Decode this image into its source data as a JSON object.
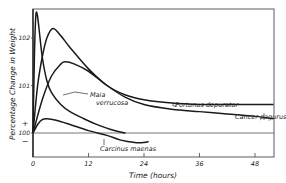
{
  "chart_data": {
    "type": "line",
    "title": "",
    "xlabel": "Time (hours)",
    "ylabel": "Percentage Change in Weight",
    "xlim": [
      0,
      52
    ],
    "ylim": [
      99.5,
      102.6
    ],
    "x_ticks": [
      0,
      12,
      24,
      36,
      48
    ],
    "x_tick_labels": [
      "0",
      "12",
      "24",
      "36",
      "48"
    ],
    "y_ticks": [
      100,
      101,
      102
    ],
    "y_tick_labels": [
      "100",
      "101",
      "102"
    ],
    "y_sign_labels": {
      "plus": "+",
      "minus": "−"
    },
    "reference_line": 100,
    "grid": false,
    "legend": "inline labels",
    "series": [
      {
        "name": "Maia verrucosa",
        "x": [
          0,
          0.3,
          0.6,
          0.9,
          1.3,
          2,
          3,
          4,
          6,
          8,
          11,
          14,
          17,
          20
        ],
        "values": [
          100,
          101.6,
          102.45,
          102.5,
          102.2,
          101.6,
          101.1,
          100.85,
          100.6,
          100.45,
          100.3,
          100.17,
          100.07,
          100.0
        ]
      },
      {
        "name": "Portunus depurator",
        "x": [
          0,
          1,
          2,
          3,
          4.3,
          6,
          8,
          12,
          16,
          20,
          24,
          30,
          36,
          42,
          52
        ],
        "values": [
          100,
          101.0,
          101.6,
          102.0,
          102.2,
          102.05,
          101.8,
          101.35,
          101.0,
          100.8,
          100.7,
          100.63,
          100.6,
          100.6,
          100.6
        ]
      },
      {
        "name": "Cancer pagurus",
        "x": [
          0,
          2,
          4,
          6,
          7,
          9,
          12,
          16,
          20,
          24,
          30,
          36,
          42,
          48,
          52
        ],
        "values": [
          100,
          100.7,
          101.2,
          101.45,
          101.5,
          101.45,
          101.3,
          101.0,
          100.75,
          100.6,
          100.5,
          100.45,
          100.4,
          100.35,
          100.3
        ]
      },
      {
        "name": "Carcinus maenas",
        "x": [
          0,
          1,
          2,
          3,
          5,
          8,
          12,
          16,
          19,
          22,
          24,
          25
        ],
        "values": [
          100,
          100.18,
          100.28,
          100.3,
          100.27,
          100.18,
          100.05,
          99.95,
          99.85,
          99.8,
          99.8,
          99.82
        ]
      }
    ]
  }
}
